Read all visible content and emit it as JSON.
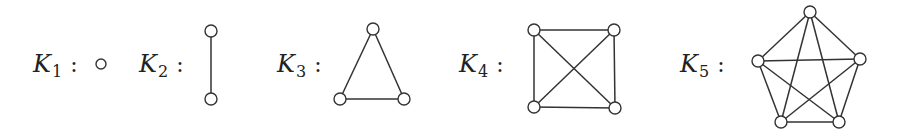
{
  "graphs": [
    {
      "name": "K1",
      "letter": "K",
      "subscript": "1",
      "colon": ":",
      "label_x": 33,
      "nodes": [
        [
          101,
          64
        ]
      ],
      "edges": []
    },
    {
      "name": "K2",
      "letter": "K",
      "subscript": "2",
      "colon": ":",
      "label_x": 139,
      "nodes": [
        [
          211,
          31
        ],
        [
          211,
          99
        ]
      ],
      "edges": [
        [
          0,
          1
        ]
      ]
    },
    {
      "name": "K3",
      "letter": "K",
      "subscript": "3",
      "colon": ":",
      "label_x": 277,
      "nodes": [
        [
          373,
          29
        ],
        [
          340,
          99
        ],
        [
          404,
          99
        ]
      ],
      "edges": [
        [
          0,
          1
        ],
        [
          0,
          2
        ],
        [
          1,
          2
        ]
      ]
    },
    {
      "name": "K4",
      "letter": "K",
      "subscript": "4",
      "colon": ":",
      "label_x": 459,
      "nodes": [
        [
          534,
          30
        ],
        [
          614,
          30
        ],
        [
          534,
          107
        ],
        [
          615,
          108
        ]
      ],
      "edges": [
        [
          0,
          1
        ],
        [
          0,
          2
        ],
        [
          0,
          3
        ],
        [
          1,
          2
        ],
        [
          1,
          3
        ],
        [
          2,
          3
        ]
      ]
    },
    {
      "name": "K5",
      "letter": "K",
      "subscript": "5",
      "colon": ":",
      "label_x": 680,
      "nodes": [
        [
          810,
          12
        ],
        [
          758,
          61
        ],
        [
          860,
          59
        ],
        [
          781,
          122
        ],
        [
          839,
          122
        ]
      ],
      "edges": [
        [
          0,
          1
        ],
        [
          0,
          2
        ],
        [
          0,
          3
        ],
        [
          0,
          4
        ],
        [
          1,
          2
        ],
        [
          1,
          3
        ],
        [
          1,
          4
        ],
        [
          2,
          3
        ],
        [
          2,
          4
        ],
        [
          3,
          4
        ]
      ]
    }
  ],
  "style": {
    "node_radius": 6,
    "k1_node_radius": 5,
    "label_baseline": 72,
    "stroke_color": "#333333",
    "background": "#ffffff"
  }
}
